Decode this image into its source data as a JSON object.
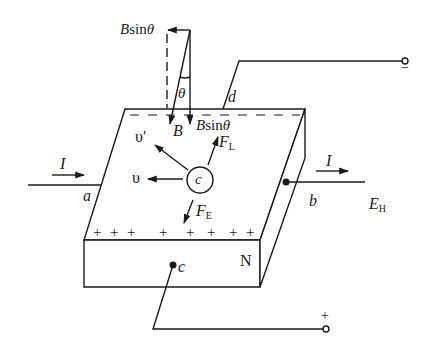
{
  "figure": {
    "colors": {
      "ink": "#1a1a1a",
      "background": "#ffffff"
    },
    "labels": {
      "b_sin_theta_top": {
        "main": "B",
        "rest": "sin",
        "theta": "θ"
      },
      "theta": "θ",
      "b": "B",
      "b_sin_theta_plate": {
        "main": "B",
        "rest": "sin",
        "theta": "θ"
      },
      "d": "d",
      "v_prime": "υ′",
      "v": "υ",
      "f_l": {
        "main": "F",
        "sub": "L"
      },
      "f_e": {
        "main": "F",
        "sub": "E"
      },
      "carrier": "c",
      "i_left": "I",
      "i_right": "I",
      "a": "a",
      "b_terminal": "b",
      "e_h": {
        "main": "E",
        "sub": "H"
      },
      "n": "N",
      "c_terminal": "c",
      "terminal_minus": "−",
      "terminal_plus": "+"
    },
    "surface_charges": {
      "top_negative": [
        "−",
        "−",
        "−",
        "−",
        "−",
        "−",
        "−",
        "−"
      ],
      "bottom_positive": [
        "+",
        "+",
        "+",
        "+",
        "+",
        "+",
        "+",
        "+"
      ]
    }
  }
}
